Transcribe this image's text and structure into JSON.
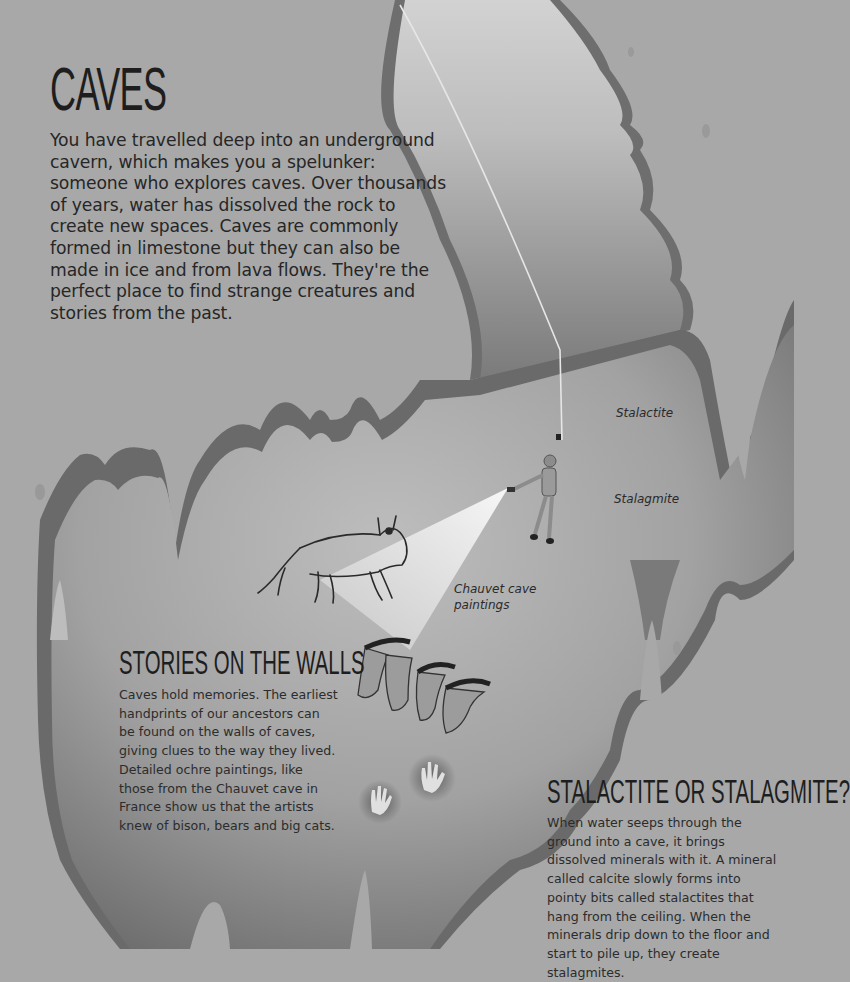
{
  "page": {
    "title": "CAVES",
    "intro": "You have travelled deep into an underground cavern, which makes you a spelunker: someone who explores caves. Over thousands of years, water has dissolved the rock to create new spaces. Caves are commonly formed in limestone but they can also be made in ice and from lava flows. They're the perfect place to find strange creatures and stories from the past.",
    "colors": {
      "background": "#a8a8a8",
      "cave_dark": "#6e6e6e",
      "cave_light": "#c4c4c4",
      "text": "#262626"
    }
  },
  "labels": {
    "stalactite": "Stalactite",
    "stalagmite": "Stalagmite",
    "chauvet_line1": "Chauvet cave",
    "chauvet_line2": "paintings"
  },
  "sections": {
    "stories": {
      "heading": "STORIES ON THE WALLS",
      "body": "Caves hold memories. The earliest handprints of our ancestors can be found on the walls of caves, giving clues to the way they lived. Detailed ochre paintings, like those from the Chauvet cave in France show us that the artists knew of bison, bears and big cats."
    },
    "stalactite_or_stalagmite": {
      "heading": "STALACTITE OR STALAGMITE?",
      "body": "When water seeps through the ground into a cave, it brings dissolved minerals with it. A mineral called calcite slowly forms into pointy bits called stalactites that hang from the ceiling. When the minerals drip down to the floor and start to pile up, they create stalagmites."
    }
  },
  "illustrations": {
    "spelunker": "person-on-rope-icon",
    "flashlight_beam": "flashlight-beam-icon",
    "bison_painting": "bison-icon",
    "horse_paintings": "horse-heads-icon",
    "handprints": "handprint-icon"
  }
}
